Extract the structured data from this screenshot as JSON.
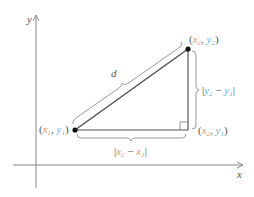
{
  "diagram": {
    "axes": {
      "x_label": "x",
      "y_label": "y"
    },
    "points": {
      "p1": {
        "x_name": "x",
        "x_sub": "1",
        "y_name": "y",
        "y_sub": "1"
      },
      "p2": {
        "x_name": "x",
        "x_sub": "2",
        "y_name": "y",
        "y_sub": "2"
      },
      "corner": {
        "x_name": "x",
        "x_sub": "2",
        "y_name": "y",
        "y_sub": "1"
      }
    },
    "labels": {
      "distance": "d",
      "horizontal": {
        "a": "x",
        "a_sub": "2",
        "minus": " − ",
        "b": "x",
        "b_sub": "1"
      },
      "vertical": {
        "a": "y",
        "a_sub": "2",
        "minus": " − ",
        "b": "y",
        "b_sub": "1"
      }
    },
    "colors": {
      "x_color": "#e0956e",
      "y_color": "#6aaed6",
      "line": "#555555",
      "bracket": "#999999"
    }
  }
}
